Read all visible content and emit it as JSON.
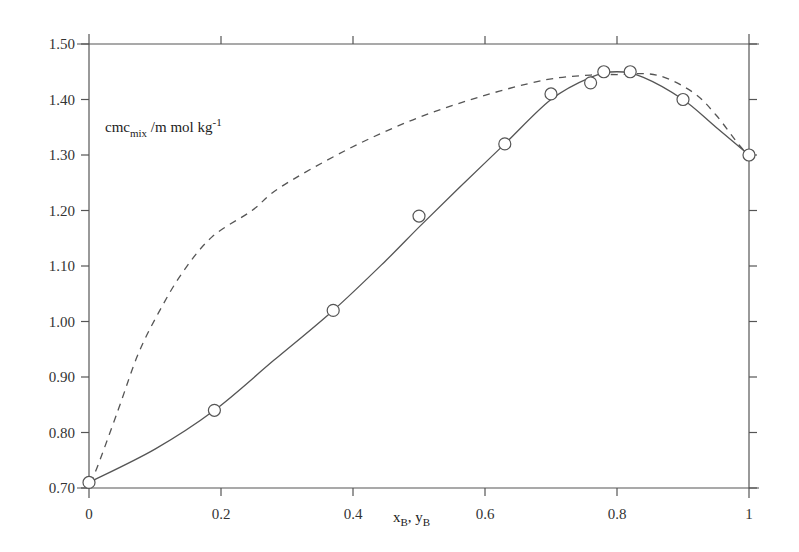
{
  "chart_data": {
    "type": "line",
    "title": "",
    "xlabel": "x_B, y_B",
    "ylabel": "cmc_mix /m mol kg-1",
    "xlim": [
      0,
      1
    ],
    "ylim": [
      0.7,
      1.5
    ],
    "grid": false,
    "legend": null,
    "x_ticks": [
      "0",
      "0.2",
      "0.4",
      "0.6",
      "0.8",
      "1"
    ],
    "y_ticks": [
      "0.70",
      "0.80",
      "0.90",
      "1.00",
      "1.10",
      "1.20",
      "1.30",
      "1.40",
      "1.50"
    ],
    "series": [
      {
        "name": "experimental cmc (points)",
        "style": "open-circle markers",
        "x": [
          0.0,
          0.19,
          0.37,
          0.5,
          0.63,
          0.7,
          0.76,
          0.78,
          0.82,
          0.9,
          1.0
        ],
        "y": [
          0.71,
          0.84,
          1.02,
          1.19,
          1.32,
          1.41,
          1.43,
          1.45,
          1.45,
          1.4,
          1.3
        ]
      },
      {
        "name": "fitted curve (x_B)",
        "style": "solid line",
        "x": [
          0.0,
          0.1,
          0.19,
          0.28,
          0.37,
          0.45,
          0.5,
          0.56,
          0.63,
          0.7,
          0.76,
          0.8,
          0.84,
          0.9,
          0.95,
          1.0
        ],
        "y": [
          0.71,
          0.77,
          0.84,
          0.93,
          1.02,
          1.11,
          1.17,
          1.24,
          1.32,
          1.4,
          1.44,
          1.45,
          1.44,
          1.4,
          1.35,
          1.3
        ]
      },
      {
        "name": "ideal / vapour-side curve (y_B)",
        "style": "dashed line",
        "x": [
          0.0,
          0.01,
          0.044,
          0.074,
          0.105,
          0.141,
          0.186,
          0.247,
          0.29,
          0.39,
          0.49,
          0.59,
          0.69,
          0.76,
          0.8,
          0.86,
          0.915,
          0.95,
          0.985,
          1.0
        ],
        "y": [
          0.71,
          0.73,
          0.84,
          0.94,
          1.015,
          1.087,
          1.152,
          1.2,
          1.242,
          1.309,
          1.363,
          1.404,
          1.435,
          1.444,
          1.445,
          1.444,
          1.413,
          1.372,
          1.318,
          1.3
        ]
      }
    ],
    "annotations": [
      {
        "text": "cmc",
        "sub": "mix",
        "rest": "/m mol kg",
        "sup": "-1",
        "x": 0.01,
        "y": 1.32
      }
    ]
  },
  "labels": {
    "y_title_main": "cmc",
    "y_title_sub": "mix",
    "y_title_rest": " /m mol kg",
    "y_title_sup": "-1",
    "x_title_x": "x",
    "x_title_xsub": "B",
    "x_title_sep": ", y",
    "x_title_ysub": "B"
  },
  "colors": {
    "axis": "#555555",
    "line": "#555555",
    "marker_edge": "#555555",
    "marker_fill": "#ffffff"
  }
}
